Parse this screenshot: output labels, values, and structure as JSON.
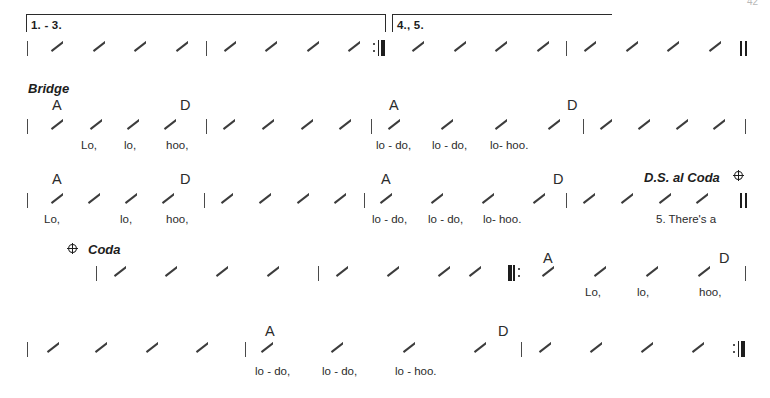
{
  "document": {
    "type": "lead-sheet",
    "page_number": "42",
    "sections": [
      {
        "id": "endings-system",
        "label": "endings",
        "voltas": [
          {
            "label": "1. - 3."
          },
          {
            "label": "4., 5."
          }
        ]
      },
      {
        "id": "bridge-system-1",
        "label": "Bridge"
      },
      {
        "id": "bridge-system-2",
        "label": ""
      },
      {
        "id": "coda-system",
        "label": "Coda"
      },
      {
        "id": "final-system",
        "label": ""
      }
    ]
  },
  "markings": {
    "bridge": "Bridge",
    "coda": "Coda",
    "ds_al_coda": "D.S. al Coda",
    "coda_symbol_name": "coda-symbol",
    "segno_jump_symbol_name": "coda-symbol"
  },
  "volta_1_label": "1. - 3.",
  "volta_2_label": "4., 5.",
  "chords": {
    "A": "A",
    "D": "D"
  },
  "systems": [
    {
      "name": "endings-system",
      "chords": [],
      "lyrics": []
    },
    {
      "name": "bridge-system-1",
      "chords": [
        {
          "text": "A",
          "x": 52
        },
        {
          "text": "D",
          "x": 180
        },
        {
          "text": "A",
          "x": 389
        },
        {
          "text": "D",
          "x": 567
        }
      ],
      "lyrics": [
        {
          "text": "Lo,",
          "x": 81
        },
        {
          "text": "lo,",
          "x": 124
        },
        {
          "text": "hoo,",
          "x": 166
        },
        {
          "text": "lo - do,",
          "x": 376
        },
        {
          "text": "lo - do,",
          "x": 432
        },
        {
          "text": "lo- hoo.",
          "x": 490
        }
      ]
    },
    {
      "name": "bridge-system-2",
      "chords": [
        {
          "text": "A",
          "x": 52
        },
        {
          "text": "D",
          "x": 180
        },
        {
          "text": "A",
          "x": 381
        },
        {
          "text": "D",
          "x": 553
        }
      ],
      "lyrics": [
        {
          "text": "Lo,",
          "x": 44
        },
        {
          "text": "lo,",
          "x": 120
        },
        {
          "text": "hoo,",
          "x": 166
        },
        {
          "text": "lo - do,",
          "x": 372
        },
        {
          "text": "lo - do,",
          "x": 428
        },
        {
          "text": "lo- hoo.",
          "x": 483
        },
        {
          "text": "5. There's  a",
          "x": 656
        }
      ]
    },
    {
      "name": "coda-system",
      "chords": [
        {
          "text": "A",
          "x": 543
        },
        {
          "text": "D",
          "x": 719
        }
      ],
      "lyrics": [
        {
          "text": "Lo,",
          "x": 585
        },
        {
          "text": "lo,",
          "x": 637
        },
        {
          "text": "hoo,",
          "x": 699
        }
      ]
    },
    {
      "name": "final-system",
      "chords": [
        {
          "text": "A",
          "x": 265
        },
        {
          "text": "D",
          "x": 498
        }
      ],
      "lyrics": [
        {
          "text": "lo -  do,",
          "x": 255
        },
        {
          "text": "lo -  do,",
          "x": 322
        },
        {
          "text": "lo - hoo.",
          "x": 395
        }
      ]
    }
  ],
  "colors": {
    "ink": "#231f20",
    "slash": "#3c3c3c",
    "barline": "#4a4a4a",
    "page_number": "#b9b9b9",
    "background": "#ffffff"
  }
}
